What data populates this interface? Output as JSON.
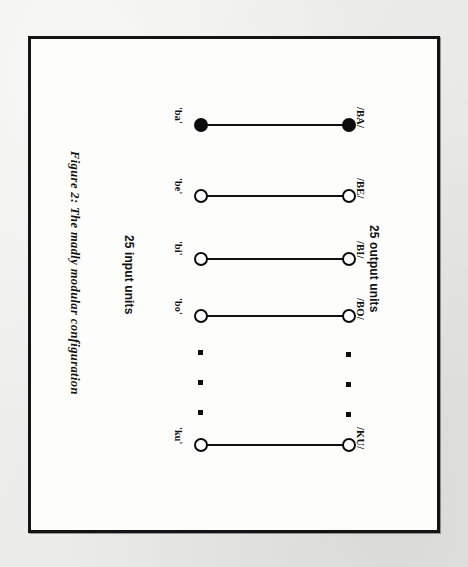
{
  "figure": {
    "caption": "Figure 2:   The madly modular configuration",
    "caption_prefix": "Figure 2:",
    "caption_body": "The madly modular configuration",
    "input_group_label": "25 input units",
    "output_group_label": "25 output units",
    "colors": {
      "page_background": "#e9e9e7",
      "panel_background": "#fdfdfc",
      "ink": "#111111",
      "border": "#141414"
    },
    "rows": [
      {
        "input_label": "'ba'",
        "output_label": "/BA/",
        "filled": true
      },
      {
        "input_label": "'be'",
        "output_label": "/BE/",
        "filled": false
      },
      {
        "input_label": "'bi'",
        "output_label": "/BI/",
        "filled": false
      },
      {
        "input_label": "'bo'",
        "output_label": "/BO/",
        "filled": false
      },
      {
        "input_label": "'ku'",
        "output_label": "/KU/",
        "filled": false
      }
    ],
    "ellipsis": {
      "symbol": "square-dot",
      "count_per_column": 3,
      "columns": [
        "input",
        "output"
      ]
    }
  }
}
